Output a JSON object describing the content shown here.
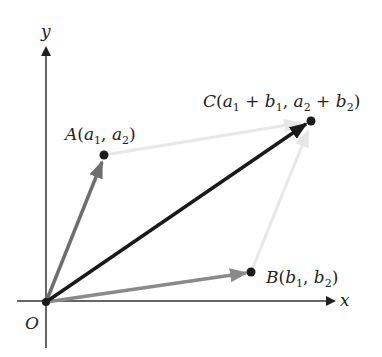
{
  "diagram": {
    "type": "vector-addition-parallelogram",
    "axes": {
      "x_label": "x",
      "y_label": "y",
      "origin_label": "O"
    },
    "points": {
      "A": {
        "name": "A",
        "coord_1": "a",
        "sub_1": "1",
        "coord_2": "a",
        "sub_2": "2"
      },
      "B": {
        "name": "B",
        "coord_1": "b",
        "sub_1": "1",
        "coord_2": "b",
        "sub_2": "2"
      },
      "C": {
        "name": "C",
        "a1": "a",
        "a1_sub": "1",
        "plus": "+",
        "b1": "b",
        "b1_sub": "1",
        "a2": "a",
        "a2_sub": "2",
        "b2": "b",
        "b2_sub": "2"
      }
    },
    "vectors": [
      {
        "name": "OA",
        "color": "#6e6e6e"
      },
      {
        "name": "OB",
        "color": "#8a8a8a"
      },
      {
        "name": "OC",
        "color": "#1a1a1a"
      },
      {
        "name": "AC",
        "color": "#e6e6e6"
      },
      {
        "name": "BC",
        "color": "#e6e6e6"
      }
    ],
    "colors": {
      "axis": "#333333",
      "point": "#1a1a1a",
      "background": "#ffffff"
    }
  }
}
